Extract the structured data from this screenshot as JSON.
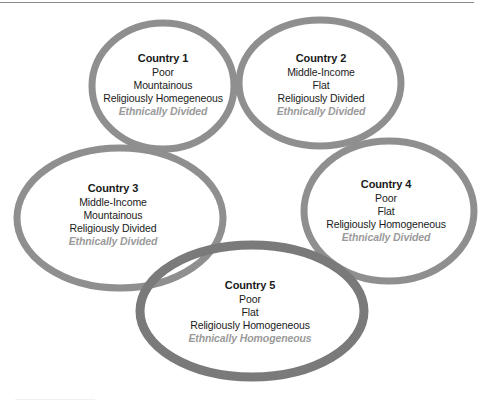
{
  "diagram": {
    "type": "overlapping-ellipses",
    "colors": {
      "ring": "#8f8f8f",
      "ring_highlight": "#7a7a7a",
      "title_text": "#1a1a1a",
      "body_text": "#1a1a1a",
      "ethnic_text": "#9a9a9a"
    },
    "countries": [
      {
        "title": "Country 1",
        "income": "Poor",
        "terrain": "Mountainous",
        "religion": "Religiously Homegeneous",
        "ethnicity": "Ethnically Divided"
      },
      {
        "title": "Country 2",
        "income": "Middle-Income",
        "terrain": "Flat",
        "religion": "Religiously Divided",
        "ethnicity": "Ethnically Divided"
      },
      {
        "title": "Country 3",
        "income": "Middle-Income",
        "terrain": "Mountainous",
        "religion": "Religiously Divided",
        "ethnicity": "Ethnically Divided"
      },
      {
        "title": "Country 4",
        "income": "Poor",
        "terrain": "Flat",
        "religion": "Religiously Homogeneous",
        "ethnicity": "Ethnically Divided"
      },
      {
        "title": "Country 5",
        "income": "Poor",
        "terrain": "Flat",
        "religion": "Religiously Homogeneous",
        "ethnicity": "Ethnically Homogeneous"
      }
    ]
  }
}
